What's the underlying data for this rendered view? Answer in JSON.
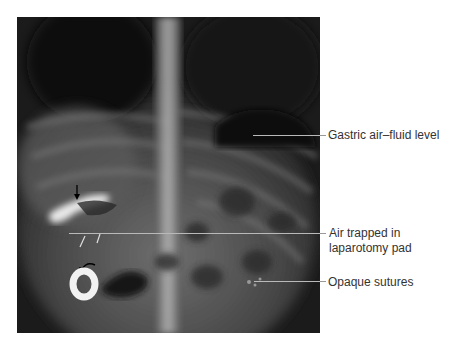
{
  "figure": {
    "image_description": "Abdominal X-ray radiograph (frontal view)",
    "colors": {
      "background": "#ffffff",
      "xray_dark": "#1a1a1a",
      "leader_line": "#b9b9b9",
      "label_text": "#333333"
    },
    "annotations": [
      {
        "id": "gastric",
        "text": "Gastric air–fluid level"
      },
      {
        "id": "air-trapped",
        "line1": "Air trapped in",
        "line2": "laparotomy pad"
      },
      {
        "id": "sutures",
        "text": "Opaque sutures"
      }
    ],
    "markers": [
      {
        "type": "straight-arrow",
        "description": "black arrow pointing down at bright gas shadow"
      },
      {
        "type": "curved-arrow",
        "description": "curved black arrow over ring marker"
      },
      {
        "type": "tick-marks",
        "description": "two small white oblique tick marks"
      },
      {
        "type": "ring",
        "description": "white radiopaque ring"
      }
    ]
  }
}
